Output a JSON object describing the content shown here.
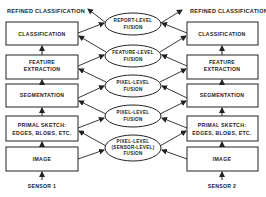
{
  "output_label_left": "REFINED  CLASSIFICATION",
  "output_label_right": "REFINED  CLASSIFICATION",
  "left_stack": {
    "sensor": "SENSOR  1",
    "boxes": [
      {
        "line1": "CLASSIFICATION",
        "line2": ""
      },
      {
        "line1": "FEATURE",
        "line2": "EXTRACTION"
      },
      {
        "line1": "SEGMENTATION",
        "line2": ""
      },
      {
        "line1": "PRIMAL  SKETCH:",
        "line2": "EDGES,  BLOBS,  ETC."
      },
      {
        "line1": "IMAGE",
        "line2": ""
      }
    ]
  },
  "right_stack": {
    "sensor": "SENSOR  2",
    "boxes": [
      {
        "line1": "CLASSIFICATION",
        "line2": ""
      },
      {
        "line1": "FEATURE",
        "line2": "EXTRACTION"
      },
      {
        "line1": "SEGMENTATION",
        "line2": ""
      },
      {
        "line1": "PRIMAL  SKETCH:",
        "line2": "EDGES,  BLOBS,  ETC."
      },
      {
        "line1": "IMAGE",
        "line2": ""
      }
    ]
  },
  "fusion_nodes": [
    {
      "line1": "REPORT-LEVEL",
      "line2": "FUSION",
      "line3": ""
    },
    {
      "line1": "FEATURE-LEVEL",
      "line2": "FUSION",
      "line3": ""
    },
    {
      "line1": "PIXEL-LEVEL",
      "line2": "FUSION",
      "line3": ""
    },
    {
      "line1": "PIXEL-LEVEL",
      "line2": "FUSION",
      "line3": ""
    },
    {
      "line1": "PIXEL-LEVEL",
      "line2": "(SENSOR-LEVEL)",
      "line3": "FUSION"
    }
  ]
}
